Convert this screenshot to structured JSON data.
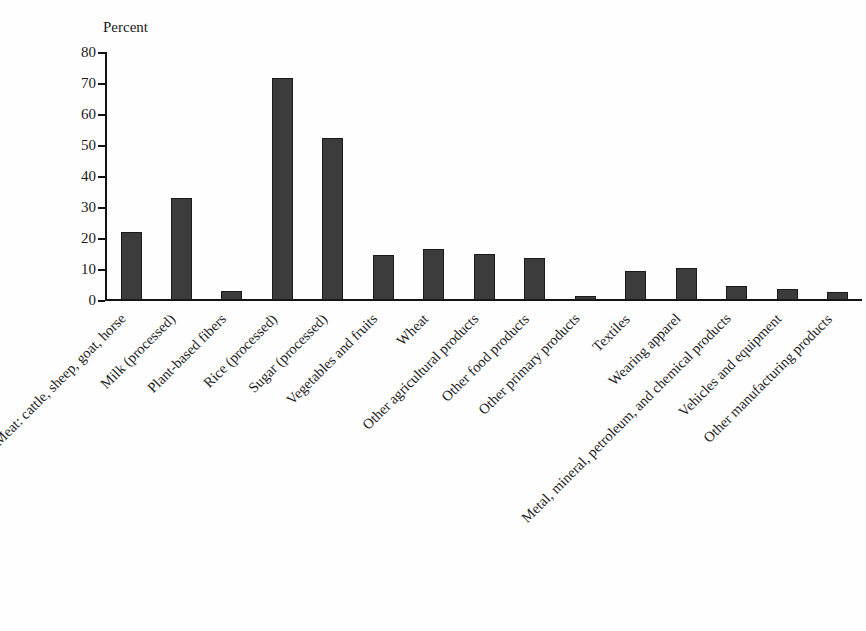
{
  "chart_data": {
    "type": "bar",
    "title": "",
    "subtitle": "",
    "xlabel": "",
    "ylabel": "Percent",
    "ylim": [
      0,
      80
    ],
    "yticks": [
      0,
      10,
      20,
      30,
      40,
      50,
      60,
      70,
      80
    ],
    "ytick_labels": [
      "0",
      "10",
      "20",
      "30",
      "40",
      "50",
      "60",
      "70",
      "80"
    ],
    "grid": false,
    "legend": null,
    "legend_position": "none",
    "bar_color": "#3c3c3c",
    "bar_edge_color": "#1b1b1b",
    "axis_color": "#141414",
    "background_color": "#fefefe",
    "xtick_rotation": -45,
    "categories": [
      "Meat: cattle, sheep, goat, horse",
      "Milk (processed)",
      "Plant-based fibers",
      "Rice (processed)",
      "Sugar (processed)",
      "Vegetables and fruits",
      "Wheat",
      "Other agricultural products",
      "Other food products",
      "Other primary products",
      "Textiles",
      "Wearing apparel",
      "Metal, mineral, petroleum, and chemical products",
      "Vehicles and equipment",
      "Other manufacturing products"
    ],
    "values": [
      21.8,
      33.0,
      2.8,
      71.5,
      52.2,
      14.5,
      16.3,
      14.7,
      13.7,
      1.3,
      9.3,
      10.4,
      4.6,
      3.7,
      2.6
    ]
  }
}
